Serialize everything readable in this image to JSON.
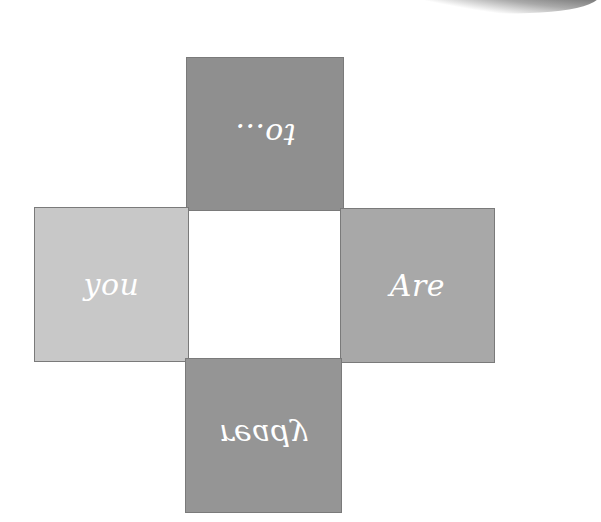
{
  "diagram": {
    "type": "cross-of-squares",
    "reading_order": [
      "right",
      "left",
      "bottom",
      "top"
    ],
    "squares": {
      "top": {
        "label": "to...",
        "color": "#8f8f8f",
        "orientation": "rotated-180"
      },
      "left": {
        "label": "you",
        "color": "#c8c8c8",
        "orientation": "upright"
      },
      "right": {
        "label": "Are",
        "color": "#a8a8a8",
        "orientation": "upright"
      },
      "bottom": {
        "label": "ready",
        "color": "#959595",
        "orientation": "flipped-vertical"
      }
    },
    "center_color": "#ffffff",
    "text_color": "#ffffff"
  }
}
